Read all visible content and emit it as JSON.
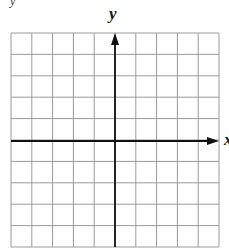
{
  "chart_data": {
    "type": "diagram",
    "title": "",
    "xlabel": "x",
    "ylabel": "y",
    "grid": true,
    "grid_cells": {
      "columns": 10,
      "rows": 10
    },
    "xlim": [
      -5,
      5
    ],
    "ylim": [
      -5,
      5
    ],
    "axes_origin_cell": {
      "column": 5,
      "row": 5
    },
    "series": []
  },
  "labels": {
    "y_axis": "y",
    "x_axis": "x",
    "corner_mark": "y"
  },
  "colors": {
    "grid_line": "#9a9a9a",
    "axis_line": "#111111",
    "background": "#ffffff"
  }
}
